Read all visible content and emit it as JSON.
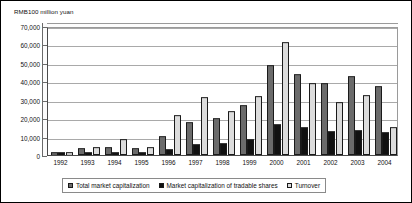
{
  "chart_data": {
    "type": "bar",
    "title": "",
    "subtitle": "",
    "unit_label": "RMB100 million yuan",
    "xlabel": "",
    "ylabel": "",
    "ylim": [
      0,
      70000
    ],
    "ytick_step": 10000,
    "grid": true,
    "legend_position": "bottom",
    "categories": [
      "1992",
      "1993",
      "1994",
      "1995",
      "1996",
      "1997",
      "1998",
      "1999",
      "2000",
      "2001",
      "2002",
      "2003",
      "2004"
    ],
    "ytick_labels": [
      "70,000",
      "60,000",
      "50,000",
      "40,000",
      "30,000",
      "20,000",
      "10,000",
      "0"
    ],
    "ytick_values": [
      70000,
      60000,
      50000,
      40000,
      30000,
      20000,
      10000,
      0
    ],
    "series": [
      {
        "name": "Total market capitalization",
        "color": "#6b6b6b",
        "values": [
          1048,
          3531,
          3691,
          3474,
          9842,
          17529,
          19506,
          26471,
          48091,
          43522,
          38329,
          42458,
          37056
        ]
      },
      {
        "name": "Market capitalization of tradable shares",
        "color": "#111111",
        "values": [
          861,
          862,
          969,
          938,
          2867,
          5204,
          5746,
          8214,
          16088,
          14463,
          12485,
          13179,
          11689
        ]
      },
      {
        "name": "Turnover",
        "color": "#dcdcdc",
        "values": [
          681,
          3627,
          8128,
          4036,
          21332,
          30722,
          23544,
          31320,
          60827,
          38305,
          27990,
          32115,
          14440
        ]
      }
    ]
  },
  "legend": {
    "items": [
      {
        "label": "Total market capitalization",
        "swatch": "swatch-total"
      },
      {
        "label": "Market capitalization of tradable shares",
        "swatch": "swatch-tradable"
      },
      {
        "label": "Turnover",
        "swatch": "swatch-turnover"
      }
    ]
  }
}
